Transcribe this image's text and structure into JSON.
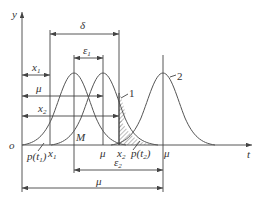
{
  "diagram": {
    "axes": {
      "y_label": "y",
      "x_label": "t",
      "origin_label": "o"
    },
    "dimensions": {
      "delta": "δ",
      "epsilon1": "ε",
      "epsilon1_sub": "1",
      "epsilon2": "ε",
      "epsilon2_sub": "2",
      "x1": "x",
      "x1_sub": "1",
      "mu_top": "μ",
      "x2": "x",
      "x2_sub": "2",
      "mu_bottom": "μ"
    },
    "axis_marks": {
      "x1": "x",
      "x1_sub": "1",
      "M": "M",
      "mu1": "μ",
      "x2": "x",
      "x2_sub": "2",
      "mu2": "μ",
      "p_t1": "p(t",
      "p_t1_sub": "1",
      "p_t1_close": ")",
      "p_t2": "p(t",
      "p_t2_sub": "2",
      "p_t2_close": ")"
    },
    "curve_labels": {
      "curve1": "1",
      "curve2": "2"
    },
    "colors": {
      "line": "#444444",
      "hatch": "#555555",
      "background": "#ffffff"
    }
  }
}
